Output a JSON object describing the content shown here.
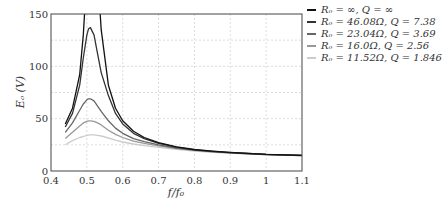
{
  "chart_data": {
    "type": "line",
    "title": "",
    "xlabel": "f/f₀",
    "ylabel": "Eₒ (V)",
    "xlim": [
      0.4,
      1.1
    ],
    "ylim": [
      0,
      150
    ],
    "xticks": [
      "0.4",
      "0.5",
      "0.6",
      "0.7",
      "0.8",
      "0.9",
      "1",
      "1.1"
    ],
    "yticks": [
      "0",
      "50",
      "100",
      "150"
    ],
    "grid": true,
    "legend_position": "outside-right-top",
    "x": [
      0.44,
      0.46,
      0.48,
      0.49,
      0.5,
      0.505,
      0.51,
      0.52,
      0.53,
      0.54,
      0.56,
      0.58,
      0.6,
      0.63,
      0.66,
      0.7,
      0.75,
      0.8,
      0.85,
      0.9,
      0.95,
      1.0,
      1.05,
      1.1
    ],
    "series": [
      {
        "name": "Rₒ = ∞,  Q = ∞",
        "color": "#111111",
        "values": [
          45,
          60,
          92,
          130,
          null,
          null,
          null,
          null,
          null,
          135,
          82,
          60,
          48,
          38,
          32,
          27,
          23,
          20.5,
          19,
          17.8,
          16.8,
          16,
          15.5,
          15
        ]
      },
      {
        "name": "Rₒ = 46.08Ω,  Q = 7.38",
        "color": "#333333",
        "values": [
          42,
          55,
          82,
          108,
          130,
          136,
          137,
          130,
          112,
          94,
          72,
          55,
          45,
          36,
          31,
          26.5,
          22.8,
          20.3,
          18.8,
          17.6,
          16.7,
          15.9,
          15.4,
          14.9
        ]
      },
      {
        "name": "Rₒ = 23.04Ω,  Q = 3.69",
        "color": "#666666",
        "values": [
          37,
          46,
          58,
          64,
          68,
          69,
          69,
          67,
          62,
          57,
          48,
          41,
          36,
          31,
          28,
          25,
          22,
          20,
          18.5,
          17.4,
          16.5,
          15.8,
          15.3,
          14.8
        ]
      },
      {
        "name": "Rₒ = 16.0Ω,  Q = 2.56",
        "color": "#999999",
        "values": [
          31,
          37,
          43,
          46,
          47.5,
          48,
          48,
          47.5,
          46,
          44,
          39,
          35,
          32,
          28.5,
          26.5,
          24,
          21.5,
          19.7,
          18.3,
          17.3,
          16.4,
          15.7,
          15.2,
          14.7
        ]
      },
      {
        "name": "Rₒ = 11.52Ω,  Q = 1.846",
        "color": "#cccccc",
        "values": [
          25,
          29,
          32,
          33,
          34,
          34.3,
          34.5,
          34.5,
          34,
          33.4,
          31.5,
          29.5,
          27.7,
          25.8,
          24.3,
          22.6,
          20.6,
          19.1,
          17.9,
          17,
          16.2,
          15.6,
          15.1,
          14.6
        ]
      }
    ]
  }
}
